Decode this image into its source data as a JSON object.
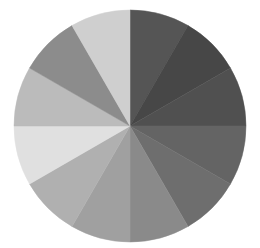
{
  "chart_data": {
    "type": "pie",
    "title": "",
    "legend": [],
    "center": [
      130,
      126
    ],
    "radius": 116,
    "start_angle_deg": 0,
    "direction": "clockwise",
    "categories": [
      "1",
      "2",
      "3",
      "4",
      "5",
      "6",
      "7",
      "8",
      "9",
      "10",
      "11",
      "12"
    ],
    "values": [
      1,
      1,
      1,
      1,
      1,
      1,
      1,
      1,
      1,
      1,
      1,
      1
    ],
    "colors": [
      "#555555",
      "#474747",
      "#505050",
      "#646464",
      "#6e6e6e",
      "#8a8a8a",
      "#a0a0a0",
      "#b0b0b0",
      "#e0e0e0",
      "#bbbbbb",
      "#8c8c8c",
      "#cfcfcf"
    ]
  }
}
